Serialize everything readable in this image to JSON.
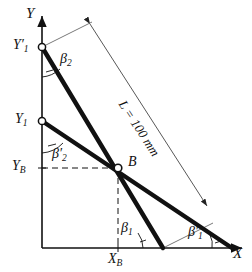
{
  "figure": {
    "type": "kinematic-diagram"
  },
  "axes": {
    "y_axis_label": "Y",
    "x_axis_label": "X"
  },
  "points": {
    "b_label": "B",
    "b_x": 118,
    "b_y": 168
  },
  "axis_ticks": {
    "y1_prime_label": "Y",
    "y1_prime_sub": "1",
    "y1_prime_prime": "′",
    "y1_label": "Y",
    "y1_sub": "1",
    "yb_label": "Y",
    "yb_sub": "B",
    "xb_label": "X",
    "xb_sub": "B"
  },
  "angles": {
    "beta2": "β",
    "beta2_sub": "2",
    "beta2_prime": "β",
    "beta2_prime_sub": "2",
    "beta2_prime_mark": "′",
    "beta1": "β",
    "beta1_sub": "1",
    "beta1_prime": "β",
    "beta1_prime_sub": "1",
    "beta1_prime_mark": "′"
  },
  "dimension": {
    "length_label": "L = 100 mm"
  },
  "colors": {
    "ink": "#111111",
    "thin": "#555555",
    "background": "#ffffff"
  }
}
